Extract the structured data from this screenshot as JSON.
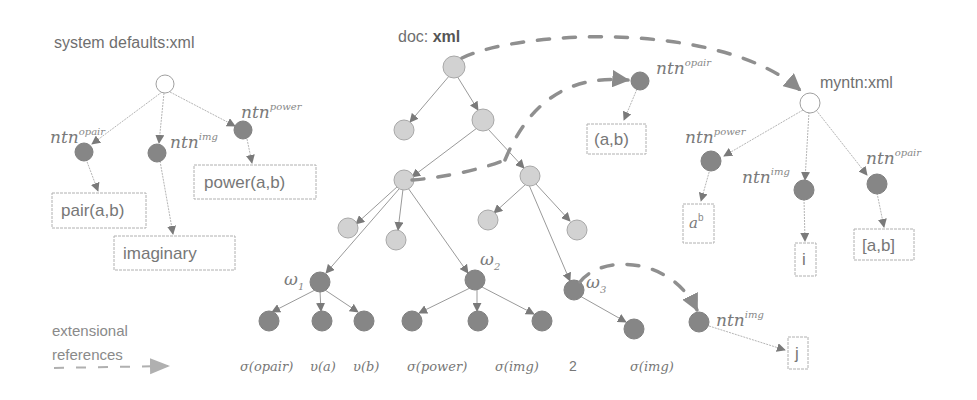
{
  "colors": {
    "background": "#ffffff",
    "node_light": "#d2d2d2",
    "node_dark": "#868686",
    "edge": "#9a9a9a",
    "dashed_reference": "#8f8f8f",
    "text": "#777777"
  },
  "left_tree": {
    "title": "system defaults:xml",
    "nodes": [
      {
        "base": "ntn",
        "sup": "opair"
      },
      {
        "base": "ntn",
        "sup": "img"
      },
      {
        "base": "ntn",
        "sup": "power"
      }
    ],
    "boxes": [
      "pair(a,b)",
      "imaginary",
      "power(a,b)"
    ]
  },
  "center_tree": {
    "title_prefix": "doc: ",
    "title_bold": "xml",
    "omega_labels": [
      {
        "base": "ω",
        "sub": "1"
      },
      {
        "base": "ω",
        "sub": "2"
      },
      {
        "base": "ω",
        "sub": "3"
      }
    ],
    "leaves": [
      "σ(opair)",
      "υ(a)",
      "υ(b)",
      "σ(power)",
      "σ(img)",
      "2",
      "σ(img)"
    ]
  },
  "floating_opair": {
    "node": {
      "base": "ntn",
      "sup": "opair"
    },
    "box": "(a,b)"
  },
  "right_tree": {
    "title": "myntn:xml",
    "nodes": [
      {
        "base": "ntn",
        "sup": "power"
      },
      {
        "base": "ntn",
        "sup": "img"
      },
      {
        "base": "ntn",
        "sup": "opair"
      }
    ],
    "boxes": {
      "power_base": "a",
      "power_exp": "b",
      "img": "i",
      "opair": "[a,b]"
    }
  },
  "lower_img": {
    "node": {
      "base": "ntn",
      "sup": "img"
    },
    "box": "j"
  },
  "legend": {
    "line1": "extensional",
    "line2": "references"
  }
}
